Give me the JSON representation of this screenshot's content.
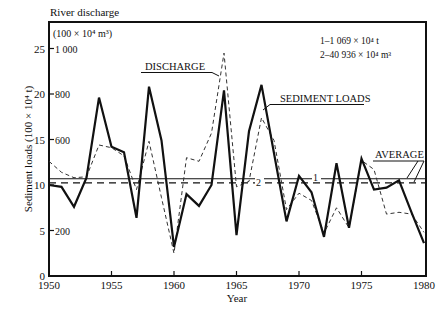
{
  "chart_data": {
    "type": "line",
    "title": "",
    "xlabel": "Year",
    "ylabel": "Sediment loads (100 × 10⁴ t)",
    "ylabel_right_title": "River discharge",
    "ylabel_right_units": "(100 × 10⁴ m³)",
    "xlim": [
      1950,
      1980
    ],
    "ylim": [
      0,
      27
    ],
    "x_ticks": [
      1950,
      1955,
      1960,
      1965,
      1970,
      1975,
      1980
    ],
    "y_ticks": [
      0,
      5,
      10,
      15,
      20,
      25
    ],
    "y2_ticks": [
      {
        "at": 5,
        "label": "200"
      },
      {
        "at": 10,
        "label": "400"
      },
      {
        "at": 15,
        "label": "600"
      },
      {
        "at": 20,
        "label": "800"
      },
      {
        "at": 25,
        "label": "1 000"
      }
    ],
    "y2_ticks_labeled": [
      "200",
      "",
      "600",
      "800",
      "1 000"
    ],
    "grid": false,
    "x": [
      1950,
      1951,
      1952,
      1953,
      1954,
      1955,
      1956,
      1957,
      1958,
      1959,
      1960,
      1961,
      1962,
      1963,
      1964,
      1965,
      1966,
      1967,
      1968,
      1969,
      1970,
      1971,
      1972,
      1973,
      1974,
      1975,
      1976,
      1977,
      1978,
      1979,
      1980
    ],
    "series": [
      {
        "name": "SEDIMENT LOADS",
        "style": "solid",
        "axis": "left",
        "values": [
          10.0,
          9.8,
          7.6,
          10.8,
          19.6,
          14.2,
          13.6,
          6.4,
          20.8,
          14.9,
          3.2,
          9.0,
          7.7,
          10.0,
          20.4,
          4.5,
          15.9,
          21.0,
          13.5,
          6.0,
          11.0,
          9.2,
          4.3,
          12.4,
          5.3,
          12.9,
          9.5,
          9.7,
          10.5,
          7.0,
          3.6
        ]
      },
      {
        "name": "DISCHARGE",
        "style": "dashed",
        "axis": "left (right axis scale ×40)",
        "values": [
          12.6,
          11.4,
          10.8,
          10.9,
          14.4,
          14.1,
          13.2,
          9.5,
          14.8,
          8.6,
          2.5,
          13.0,
          12.6,
          15.7,
          24.5,
          9.8,
          10.4,
          17.4,
          14.9,
          7.3,
          9.1,
          8.3,
          4.7,
          7.5,
          5.3,
          12.7,
          11.7,
          6.8,
          7.0,
          6.8,
          4.8
        ]
      }
    ],
    "averages": [
      {
        "id": "1",
        "value": 10.69,
        "style": "solid",
        "note": "1–1 069 × 10⁴ t"
      },
      {
        "id": "2",
        "value": 10.23,
        "style": "dashed",
        "note": "2–40 936 × 10⁴ m³"
      }
    ],
    "annotations": {
      "discharge_label": "DISCHARGE",
      "sediment_label": "SEDIMENT LOADS",
      "average_label": "AVERAGE",
      "avg1_marker": "1",
      "avg2_marker": "2",
      "legend_line1": "1–1 069 × 10⁴ t",
      "legend_line2": "2–40 936 × 10⁴ m³"
    },
    "legend_position": "top-right"
  }
}
